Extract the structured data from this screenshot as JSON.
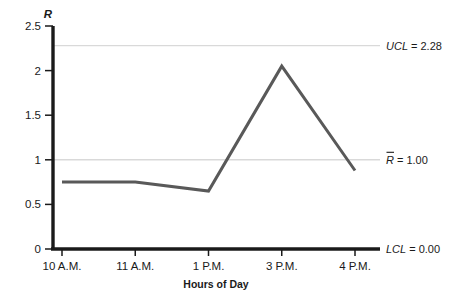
{
  "chart_data": {
    "type": "line",
    "title": "",
    "xlabel": "Hours of Day",
    "ylabel": "R",
    "categories": [
      "10 A.M.",
      "11 A.M.",
      "1 P.M.",
      "3 P.M.",
      "4 P.M."
    ],
    "values": [
      0.75,
      0.75,
      0.65,
      2.05,
      0.88
    ],
    "series": [
      {
        "name": "R",
        "values": [
          0.75,
          0.75,
          0.65,
          2.05,
          0.88
        ]
      }
    ],
    "ylim": [
      0,
      2.5
    ],
    "yticks": [
      "0",
      "0.5",
      "1",
      "1.5",
      "2",
      "2.5"
    ],
    "ytick_values": [
      0,
      0.5,
      1,
      1.5,
      2,
      2.5
    ],
    "grid": true,
    "legend": "none",
    "line_color": "#595959",
    "grid_color": "#d9d9d9",
    "axis_color": "#1a1a1a",
    "control_limits": [
      {
        "key": "ucl",
        "symbol": "UCL",
        "value": 2.28,
        "label": "UCL = 2.28",
        "label_value": "= 2.28",
        "overbar": false
      },
      {
        "key": "center",
        "symbol": "R",
        "value": 1.0,
        "label": "R = 1.00",
        "label_value": "= 1.00",
        "overbar": true
      },
      {
        "key": "lcl",
        "symbol": "LCL",
        "value": 0.0,
        "label": "LCL = 0.00",
        "label_value": "= 0.00",
        "overbar": false
      }
    ]
  },
  "axes": {
    "y_axis_symbol": "R",
    "x_axis_title": "Hours of Day"
  }
}
